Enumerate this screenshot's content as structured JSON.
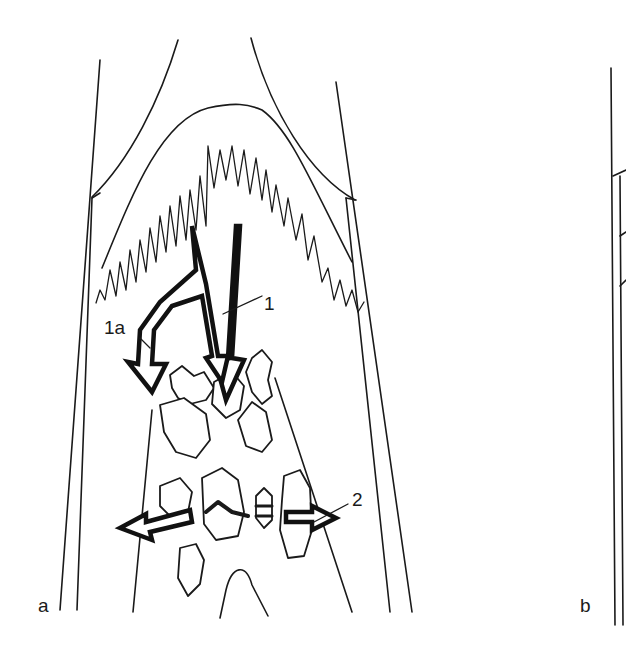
{
  "figure": {
    "panels": [
      {
        "id": "a",
        "label": "a"
      },
      {
        "id": "b",
        "label": "b"
      }
    ],
    "annotations": [
      {
        "id": "1",
        "label": "1"
      },
      {
        "id": "1a",
        "label": "1a"
      },
      {
        "id": "2",
        "label": "2"
      }
    ],
    "colors": {
      "line": "#1a1a1a",
      "background": "#ffffff"
    }
  }
}
